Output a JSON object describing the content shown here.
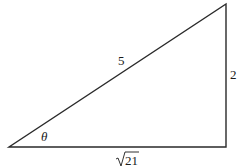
{
  "diagram": {
    "type": "right-triangle",
    "stroke_color": "#2a2a2a",
    "vertices": {
      "angle_vertex": [
        9,
        147
      ],
      "right_angle_vertex": [
        226,
        147
      ],
      "top_vertex": [
        226,
        4
      ]
    },
    "labels": {
      "hypotenuse": "5",
      "opposite": "2",
      "adjacent_radicand": "21",
      "angle": "θ"
    }
  }
}
